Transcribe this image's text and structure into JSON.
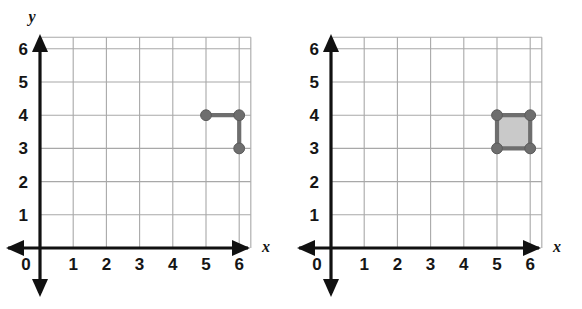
{
  "figure": {
    "background_color": "#ffffff",
    "panel_count": 2
  },
  "style": {
    "grid_color": "#a8a8a8",
    "axis_color": "#111111",
    "point_color": "#6e6e6e",
    "point_stroke_color": "#5a5a5a",
    "segment_color": "#6e6e6e",
    "square_fill_color": "#c9c9c9",
    "square_stroke_color": "#6e6e6e",
    "label_color": "#151515"
  },
  "chart_data": [
    {
      "type": "scatter",
      "name": "left-plot",
      "title": "",
      "xlabel": "x",
      "ylabel": "y",
      "show_y_axis_name": true,
      "show_x_axis_name": true,
      "xlim": [
        0,
        6.35
      ],
      "ylim": [
        0,
        6.35
      ],
      "xticks": [
        0,
        1,
        2,
        3,
        4,
        5,
        6
      ],
      "yticks": [
        1,
        2,
        3,
        4,
        5,
        6
      ],
      "xtick_labels": [
        "0",
        "1",
        "2",
        "3",
        "4",
        "5",
        "6"
      ],
      "ytick_labels": [
        "1",
        "2",
        "3",
        "4",
        "5",
        "6"
      ],
      "origin_label": "0",
      "grid": true,
      "grid_step": 1,
      "legend": "none",
      "points": [
        {
          "x": 5,
          "y": 4,
          "label": ""
        },
        {
          "x": 6,
          "y": 4,
          "label": ""
        },
        {
          "x": 6,
          "y": 3,
          "label": ""
        }
      ],
      "segments": [
        {
          "x1": 5,
          "y1": 4,
          "x2": 6,
          "y2": 4
        },
        {
          "x1": 6,
          "y1": 4,
          "x2": 6,
          "y2": 3
        }
      ],
      "polygons": []
    },
    {
      "type": "scatter",
      "name": "right-plot",
      "title": "",
      "xlabel": "x",
      "ylabel": "",
      "show_y_axis_name": false,
      "show_x_axis_name": true,
      "xlim": [
        0,
        6.35
      ],
      "ylim": [
        0,
        6.35
      ],
      "xticks": [
        0,
        1,
        2,
        3,
        4,
        5,
        6
      ],
      "yticks": [
        1,
        2,
        3,
        4,
        5,
        6
      ],
      "xtick_labels": [
        "0",
        "1",
        "2",
        "3",
        "4",
        "5",
        "6"
      ],
      "ytick_labels": [
        "1",
        "2",
        "3",
        "4",
        "5",
        "6"
      ],
      "origin_label": "0",
      "grid": true,
      "grid_step": 1,
      "legend": "none",
      "points": [
        {
          "x": 5,
          "y": 4,
          "label": ""
        },
        {
          "x": 6,
          "y": 4,
          "label": ""
        },
        {
          "x": 5,
          "y": 3,
          "label": ""
        },
        {
          "x": 6,
          "y": 3,
          "label": ""
        }
      ],
      "segments": [
        {
          "x1": 5,
          "y1": 4,
          "x2": 6,
          "y2": 4
        },
        {
          "x1": 6,
          "y1": 4,
          "x2": 6,
          "y2": 3
        },
        {
          "x1": 6,
          "y1": 3,
          "x2": 5,
          "y2": 3
        },
        {
          "x1": 5,
          "y1": 3,
          "x2": 5,
          "y2": 4
        }
      ],
      "polygons": [
        {
          "vertices": [
            [
              5,
              3
            ],
            [
              6,
              3
            ],
            [
              6,
              4
            ],
            [
              5,
              4
            ]
          ],
          "filled": true
        }
      ]
    }
  ]
}
